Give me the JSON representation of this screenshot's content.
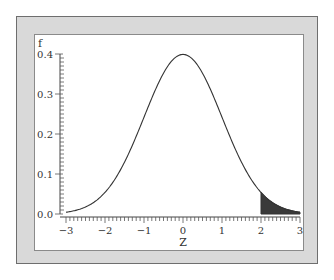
{
  "chart_data": {
    "type": "line",
    "title": "",
    "xlabel": "Z",
    "ylabel": "f",
    "xlim": [
      -3,
      3
    ],
    "ylim": [
      0,
      0.4
    ],
    "grid": false,
    "legend": null,
    "x_ticks": [
      -3,
      -2,
      -1,
      0,
      1,
      2,
      3
    ],
    "x_tick_labels": [
      "−3",
      "−2",
      "−1",
      "0",
      "1",
      "2",
      "3"
    ],
    "y_ticks": [
      0.0,
      0.1,
      0.2,
      0.3,
      0.4
    ],
    "y_tick_labels": [
      "0.0",
      "0.1",
      "0.2",
      "0.3",
      "0.4"
    ],
    "series": [
      {
        "name": "Standard normal density",
        "x": [
          -3,
          -2.5,
          -2,
          -1.5,
          -1,
          -0.5,
          0,
          0.5,
          1,
          1.5,
          2,
          2.5,
          3
        ],
        "values": [
          0.0044,
          0.0175,
          0.054,
          0.1295,
          0.242,
          0.3521,
          0.3989,
          0.3521,
          0.242,
          0.1295,
          0.054,
          0.0175,
          0.0044
        ]
      }
    ],
    "shaded_region": {
      "from": 2,
      "to": 3,
      "color": "#3a3a3a",
      "description": "upper tail area Z > 2"
    }
  },
  "colors": {
    "frame": "#d9d9d9",
    "panel": "#ffffff",
    "curve": "#333333",
    "shade": "#3a3a3a"
  }
}
